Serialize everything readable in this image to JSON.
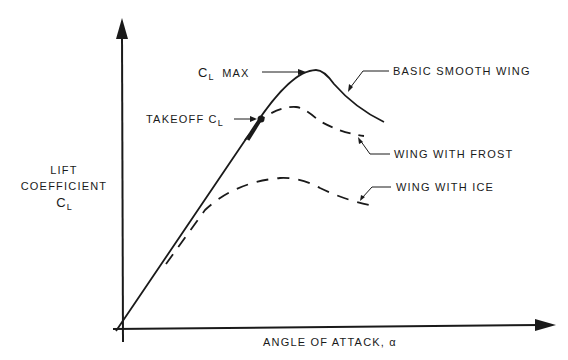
{
  "diagram": {
    "y_axis": {
      "label_line1": "LIFT",
      "label_line2": "COEFFICIENT",
      "symbol": "C",
      "symbol_sub": "L"
    },
    "x_axis": {
      "label": "ANGLE OF ATTACK, α"
    },
    "annotations": {
      "cl_max": {
        "symbol": "C",
        "sub": "L",
        "text": "MAX"
      },
      "takeoff": {
        "text": "TAKEOFF C",
        "sub": "L"
      }
    },
    "curves": [
      {
        "name": "BASIC SMOOTH WING",
        "style": "solid"
      },
      {
        "name": "WING WITH FROST",
        "style": "dashed"
      },
      {
        "name": "WING WITH ICE",
        "style": "dashed"
      }
    ],
    "colors": {
      "ink": "#1a1a1a",
      "background": "#ffffff"
    }
  }
}
